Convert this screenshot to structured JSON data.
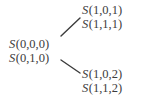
{
  "diagram": {
    "type": "binary-branching-tree",
    "text_color": "#3c3c3c",
    "background_color": "#ffffff",
    "nodes": {
      "root": {
        "position": "left-middle",
        "lines": [
          {
            "symbol": "S",
            "args": "(0,0,0)",
            "full": "S(0,0,0)"
          },
          {
            "symbol": "S",
            "args": "(0,1,0)",
            "full": "S(0,1,0)"
          }
        ]
      },
      "upper_branch": {
        "position": "upper-right",
        "lines": [
          {
            "symbol": "S",
            "args": "(1,0,1)",
            "full": "S(1,0,1)"
          },
          {
            "symbol": "S",
            "args": "(1,1,1)",
            "full": "S(1,1,1)"
          }
        ]
      },
      "lower_branch": {
        "position": "lower-right",
        "lines": [
          {
            "symbol": "S",
            "args": "(1,0,2)",
            "full": "S(1,0,2)"
          },
          {
            "symbol": "S",
            "args": "(1,1,2)",
            "full": "S(1,1,2)"
          }
        ]
      }
    },
    "edges": [
      {
        "name": "edge-root-to-upper",
        "from": "root",
        "to": "upper_branch",
        "x1": 61,
        "y1": 36,
        "x2": 80,
        "y2": 18
      },
      {
        "name": "edge-root-to-lower",
        "from": "root",
        "to": "lower_branch",
        "x1": 61,
        "y1": 60,
        "x2": 80,
        "y2": 73
      }
    ],
    "edge_color": "#3c3c3c",
    "edge_width": 1.4
  }
}
